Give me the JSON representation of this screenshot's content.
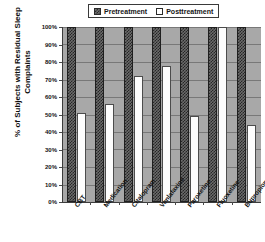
{
  "chart_data": {
    "type": "bar",
    "title": "",
    "xlabel": "",
    "ylabel": "% of Subjects with Residual Sleep Complaints",
    "ylim": [
      0,
      100
    ],
    "grid": true,
    "legend_position": "top",
    "categories": [
      "CBT",
      "Medication",
      "Citalopram",
      "Venlafaxine",
      "Paroxetine",
      "Fluoxetine",
      "Bupropion"
    ],
    "series": [
      {
        "name": "Pretreatment",
        "values": [
          100,
          100,
          100,
          100,
          100,
          100,
          100
        ]
      },
      {
        "name": "Posttreatment",
        "values": [
          51,
          56,
          72,
          78,
          49,
          100,
          44
        ]
      }
    ],
    "y_ticks": [
      "100%",
      "90%",
      "80%",
      "70%",
      "60%",
      "50%",
      "40%",
      "30%",
      "20%",
      "10%",
      "0%"
    ],
    "y_tick_values": [
      100,
      90,
      80,
      70,
      60,
      50,
      40,
      30,
      20,
      10,
      0
    ]
  },
  "legend": {
    "entries": [
      {
        "label": "Pretreatment",
        "swatch": "hatched-dark"
      },
      {
        "label": "Posttreatment",
        "swatch": "white"
      }
    ]
  },
  "colors": {
    "plot_background": "#a8a8a8",
    "gridline": "#787878",
    "axis": "#3c3c3c",
    "pretreatment_fill": "#6b6b6b",
    "pretreatment_pattern": "#262626",
    "posttreatment_fill": "#fdfdfd",
    "text": "#121212"
  }
}
